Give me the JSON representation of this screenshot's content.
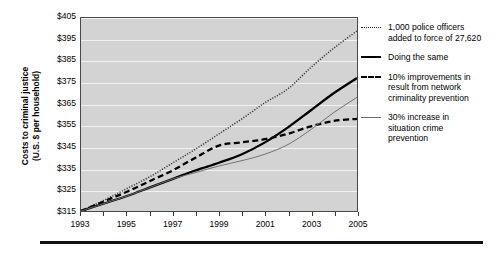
{
  "axis": {
    "y_title_line1": "Costs to criminal justice",
    "y_title_line2": "(U.S. $ per household)"
  },
  "chart_data": {
    "type": "line",
    "title": "",
    "xlabel": "",
    "ylabel": "Costs to criminal justice (U.S. $ per household)",
    "xlim": [
      1993,
      2005
    ],
    "ylim": [
      315,
      405
    ],
    "yticks": [
      315,
      325,
      335,
      345,
      355,
      365,
      375,
      385,
      395,
      405
    ],
    "ytick_labels": [
      "$315",
      "$325",
      "$335",
      "$345",
      "$355",
      "$365",
      "$375",
      "$385",
      "$395",
      "$405"
    ],
    "xticks": [
      1993,
      1994,
      1995,
      1996,
      1997,
      1998,
      1999,
      2000,
      2001,
      2002,
      2003,
      2004,
      2005
    ],
    "xtick_labels": [
      "1993",
      "",
      "1995",
      "",
      "1997",
      "",
      "1999",
      "",
      "2001",
      "",
      "2003",
      "",
      "2005"
    ],
    "xtick_labels_shown": [
      "1993",
      "1995",
      "1997",
      "1999",
      "2001",
      "2003",
      "2005"
    ],
    "grid": true,
    "grid_color": "#f2f2f2",
    "plot_bg": "#d3d3d3",
    "legend_position": "right",
    "x": [
      1993,
      1994,
      1995,
      1996,
      1997,
      1998,
      1999,
      2000,
      2001,
      2002,
      2003,
      2004,
      2005
    ],
    "series": [
      {
        "name": "1,000 police officers added to force of 27,620",
        "style": "dotted",
        "color": "#2b2b2b",
        "values": [
          315,
          320,
          325.5,
          331,
          337.5,
          344,
          351,
          358,
          365.5,
          372,
          382,
          391,
          399
        ]
      },
      {
        "name": "Doing the same",
        "style": "solid-thick",
        "color": "#000000",
        "values": [
          315,
          318.5,
          322,
          326,
          330,
          334,
          337.5,
          341.5,
          347,
          354,
          362,
          370,
          377
        ]
      },
      {
        "name": "10% improvements in result from network criminality prevention",
        "style": "dashed",
        "color": "#000000",
        "values": [
          315,
          319.5,
          324,
          329,
          334,
          340,
          345.5,
          347,
          348.5,
          351,
          354.5,
          357,
          358
        ]
      },
      {
        "name": "30% increase in situation crime prevention",
        "style": "solid-thin",
        "color": "#6f6f6f",
        "values": [
          315,
          318.5,
          322,
          326,
          330,
          333,
          336,
          338.5,
          341.5,
          346,
          353,
          361,
          368
        ]
      }
    ]
  },
  "legend": {
    "entries": [
      {
        "style": "dotted",
        "lines": [
          "1,000 police officers",
          "added to force of 27,620"
        ]
      },
      {
        "style": "solid-thick",
        "lines": [
          "Doing the same"
        ]
      },
      {
        "style": "dashed",
        "lines": [
          "10% improvements in",
          "result from network",
          "criminality prevention"
        ]
      },
      {
        "style": "solid-thin",
        "lines": [
          "30% increase in",
          "situation crime",
          "prevention"
        ]
      }
    ]
  }
}
